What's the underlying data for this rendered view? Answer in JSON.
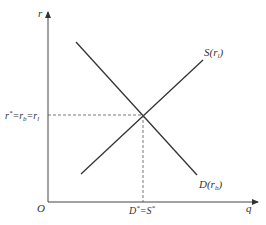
{
  "diagram": {
    "type": "supply-demand equilibrium",
    "axes": {
      "y_label": "r",
      "x_label": "q",
      "origin_label": "O"
    },
    "curves": {
      "supply": {
        "label_main": "S(r",
        "label_sub": "l",
        "label_close": ")"
      },
      "demand": {
        "label_main": "D(r",
        "label_sub": "b",
        "label_close": ")"
      }
    },
    "equilibrium": {
      "y_label": {
        "r": "r",
        "star": "*",
        "eq1": "=r",
        "sub_b": "b",
        "eq2": "=r",
        "sub_l": "l"
      },
      "x_label": {
        "d": "D",
        "star1": "*",
        "eq": "=S",
        "star2": "*"
      }
    },
    "colors": {
      "line": "#333333",
      "dash": "#555555",
      "background": "#ffffff"
    }
  }
}
